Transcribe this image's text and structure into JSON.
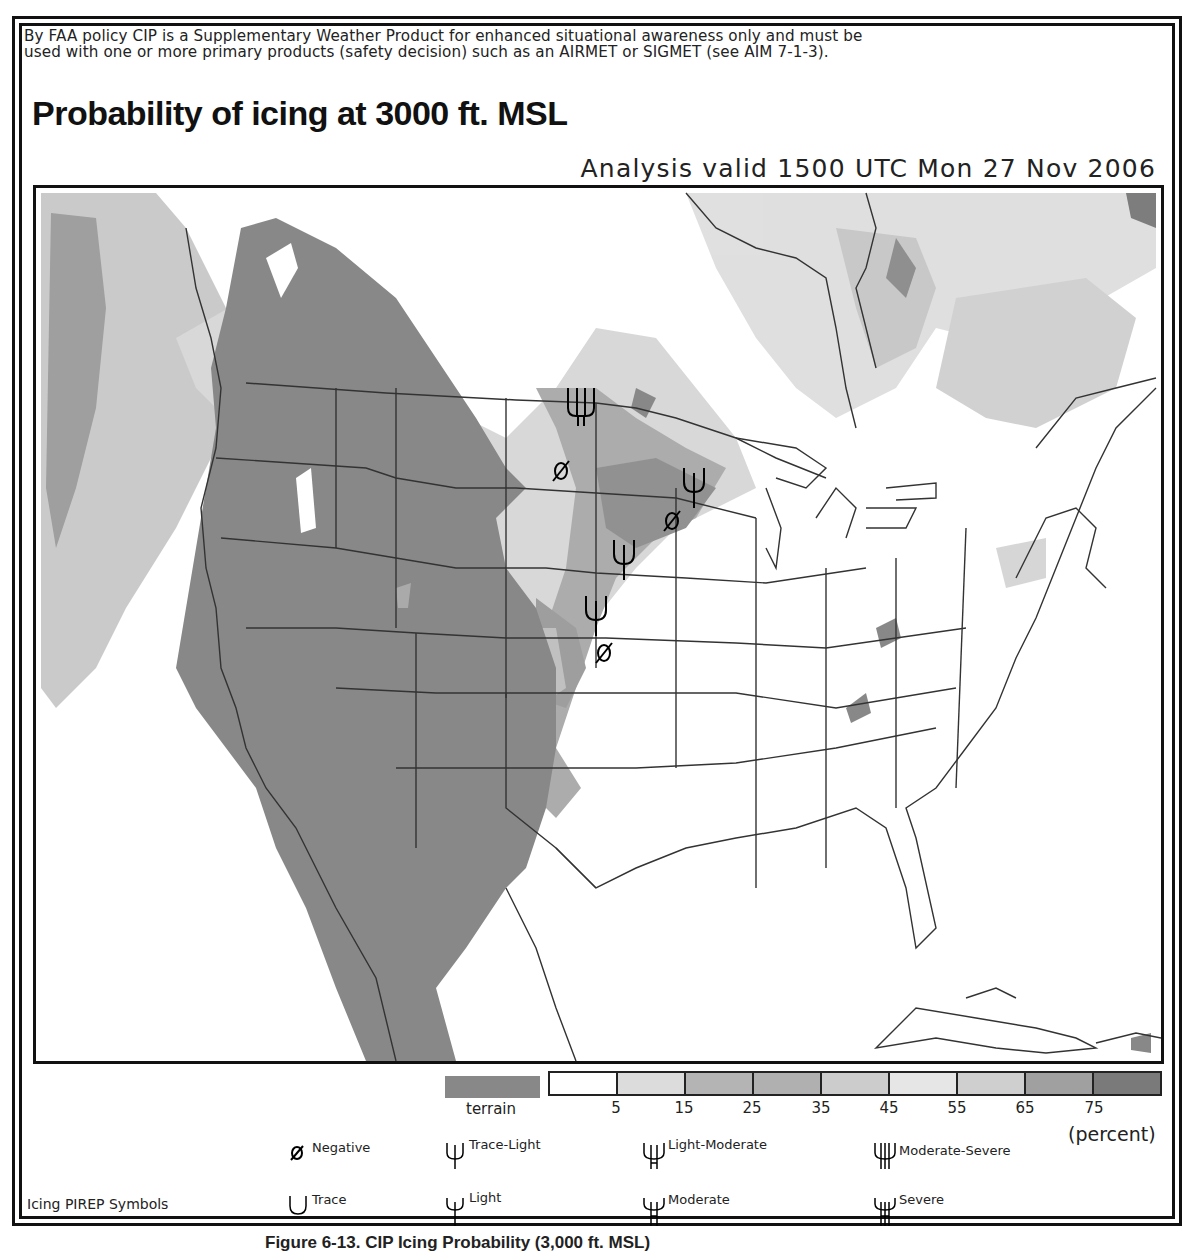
{
  "disclaimer": {
    "line1": "By FAA policy CIP is a Supplementary Weather Product for enhanced situational awareness only and must be",
    "line2": "used with one or more primary products (safety decision) such as an AIRMET or SIGMET (see AIM 7-1-3)."
  },
  "title": "Probability of icing at 3000 ft. MSL",
  "valid_time": "Analysis valid 1500 UTC Mon 27 Nov 2006",
  "map": {
    "region": "Continental United States, southern Canada, northern Mexico, Caribbean",
    "pireps": [
      {
        "type": "moderate-severe",
        "location": "North Dakota / Manitoba border"
      },
      {
        "type": "negative",
        "location": "central North Dakota"
      },
      {
        "type": "trace-light",
        "location": "northern Minnesota / Lake Superior"
      },
      {
        "type": "negative",
        "location": "eastern Minnesota"
      },
      {
        "type": "trace-light",
        "location": "southeastern South Dakota"
      },
      {
        "type": "trace-light",
        "location": "northern Kansas"
      },
      {
        "type": "negative",
        "location": "central Kansas"
      }
    ]
  },
  "legend": {
    "terrain_label": "terrain",
    "terrain_color": "#888888",
    "scale": [
      {
        "range": "0-5",
        "color": "#ffffff"
      },
      {
        "range": "5-15",
        "color": "#dcdcdc"
      },
      {
        "range": "15-25",
        "color": "#b4b4b4"
      },
      {
        "range": "25-35",
        "color": "#b0b0b0"
      },
      {
        "range": "35-45",
        "color": "#cccccc"
      },
      {
        "range": "45-55",
        "color": "#e6e6e6"
      },
      {
        "range": "55-65",
        "color": "#cfcfcf"
      },
      {
        "range": "65-75",
        "color": "#a0a0a0"
      },
      {
        "range": "75+",
        "color": "#7a7a7a"
      }
    ],
    "ticks": [
      "5",
      "15",
      "25",
      "35",
      "45",
      "55",
      "65",
      "75"
    ],
    "unit": "(percent)"
  },
  "pirep_legend": {
    "title": "Icing PIREP Symbols",
    "symbols": [
      {
        "id": "negative",
        "label": "Negative"
      },
      {
        "id": "trace-light",
        "label": "Trace-Light"
      },
      {
        "id": "light-moderate",
        "label": "Light-Moderate"
      },
      {
        "id": "moderate-severe",
        "label": "Moderate-Severe"
      },
      {
        "id": "trace",
        "label": "Trace"
      },
      {
        "id": "light",
        "label": "Light"
      },
      {
        "id": "moderate",
        "label": "Moderate"
      },
      {
        "id": "severe",
        "label": "Severe"
      }
    ]
  },
  "caption": "Figure 6-13. CIP Icing Probability (3,000 ft. MSL)"
}
